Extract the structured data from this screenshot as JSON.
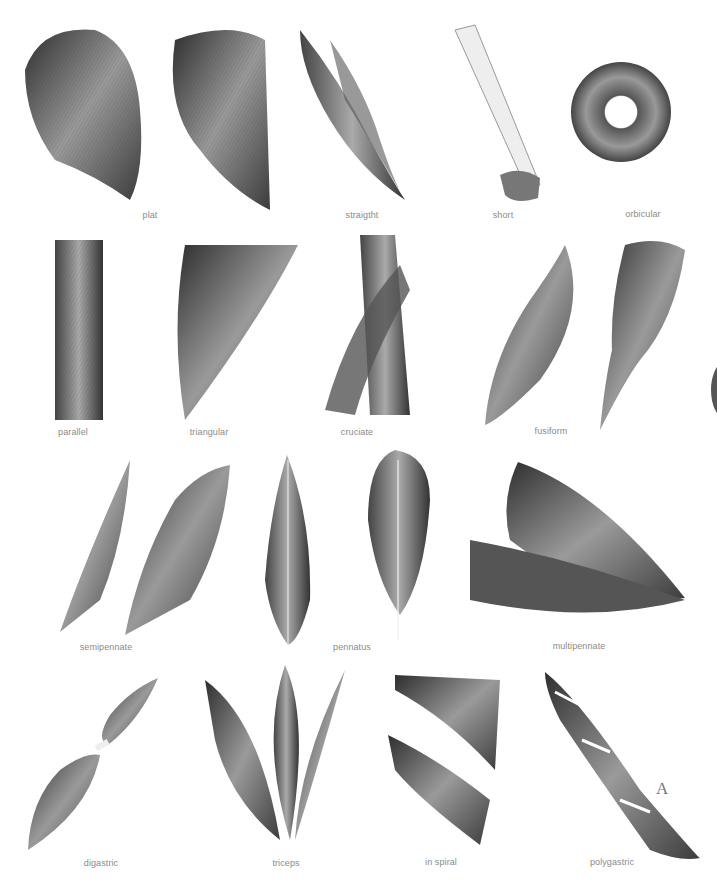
{
  "plate": {
    "corner_letter": "A",
    "rows": [
      {
        "items": [
          {
            "id": "plat",
            "label": "plat",
            "label_pos": [
              150,
              216
            ]
          },
          {
            "id": "straight",
            "label": "straigtht",
            "label_pos": [
              357,
              216
            ]
          },
          {
            "id": "short",
            "label": "short",
            "label_pos": [
              503,
              216
            ]
          },
          {
            "id": "orbicular",
            "label": "orbicular",
            "label_pos": [
              643,
              215
            ]
          }
        ]
      },
      {
        "items": [
          {
            "id": "parallel",
            "label": "parallel",
            "label_pos": [
              73,
              433
            ]
          },
          {
            "id": "triangular",
            "label": "triangular",
            "label_pos": [
              209,
              433
            ]
          },
          {
            "id": "cruciate",
            "label": "cruciate",
            "label_pos": [
              357,
              433
            ]
          },
          {
            "id": "fusiform",
            "label": "fusiform",
            "label_pos": [
              551,
              432
            ]
          }
        ]
      },
      {
        "items": [
          {
            "id": "semipennate",
            "label": "semipennate",
            "label_pos": [
              106,
              647
            ]
          },
          {
            "id": "pennatus",
            "label": "pennatus",
            "label_pos": [
              352,
              647
            ]
          },
          {
            "id": "multipennate",
            "label": "multipennate",
            "label_pos": [
              579,
              646
            ]
          }
        ]
      },
      {
        "items": [
          {
            "id": "digastric",
            "label": "digastric",
            "label_pos": [
              101,
              863
            ]
          },
          {
            "id": "triceps",
            "label": "triceps",
            "label_pos": [
              286,
              863
            ]
          },
          {
            "id": "in-spiral",
            "label": "in spiral",
            "label_pos": [
              441,
              862
            ]
          },
          {
            "id": "polygastric",
            "label": "polygastric",
            "label_pos": [
              612,
              862
            ]
          }
        ]
      }
    ]
  },
  "colors": {
    "background": "#ffffff",
    "label": "#8a8a8a",
    "muscle_dark": "#3a3a3a",
    "muscle_mid": "#8a8a8a",
    "tendon": "#e8e8e8"
  }
}
